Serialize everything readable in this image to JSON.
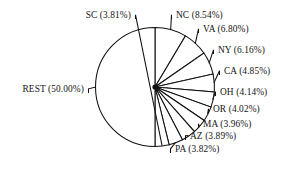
{
  "chart_data": {
    "type": "pie",
    "title": "",
    "subtitle": "",
    "xlabel": "",
    "ylabel": "",
    "legend": "none",
    "grid": false,
    "labels_include_percent": true,
    "percent_format": "0.00%",
    "categories": [
      "NC",
      "VA",
      "NY",
      "CA",
      "OH",
      "OR",
      "MA",
      "AZ",
      "PA",
      "SC",
      "REST"
    ],
    "values": [
      8.54,
      6.8,
      6.16,
      4.85,
      4.14,
      4.02,
      3.96,
      3.89,
      3.82,
      3.81,
      50.0
    ],
    "slices": [
      {
        "name": "NC",
        "value": 8.54,
        "label": "NC (8.54%)",
        "side": "right"
      },
      {
        "name": "VA",
        "value": 6.8,
        "label": "VA (6.80%)",
        "side": "right"
      },
      {
        "name": "NY",
        "value": 6.16,
        "label": "NY (6.16%)",
        "side": "right"
      },
      {
        "name": "CA",
        "value": 4.85,
        "label": "CA (4.85%)",
        "side": "right"
      },
      {
        "name": "OH",
        "value": 4.14,
        "label": "OH (4.14%)",
        "side": "right"
      },
      {
        "name": "OR",
        "value": 4.02,
        "label": "OR (4.02%)",
        "side": "right"
      },
      {
        "name": "MA",
        "value": 3.96,
        "label": "MA (3.96%)",
        "side": "right"
      },
      {
        "name": "AZ",
        "value": 3.89,
        "label": "AZ (3.89%)",
        "side": "right"
      },
      {
        "name": "PA",
        "value": 3.82,
        "label": "PA (3.82%)",
        "side": "right"
      },
      {
        "name": "SC",
        "value": 3.81,
        "label": "SC (3.81%)",
        "side": "left"
      },
      {
        "name": "REST",
        "value": 50.0,
        "label": "REST (50.00%)",
        "side": "left"
      }
    ],
    "colors": {
      "slice_fill": "#ffffff",
      "slice_stroke": "#111111",
      "label_text": "#141414",
      "background": "#ffffff"
    }
  },
  "labels": {
    "nc": "NC (8.54%)",
    "va": "VA (6.80%)",
    "ny": "NY (6.16%)",
    "ca": "CA (4.85%)",
    "oh": "OH (4.14%)",
    "or": "OR (4.02%)",
    "ma": "MA (3.96%)",
    "az": "AZ (3.89%)",
    "pa": "PA (3.82%)",
    "sc": "SC (3.81%)",
    "rest": "REST (50.00%)"
  }
}
